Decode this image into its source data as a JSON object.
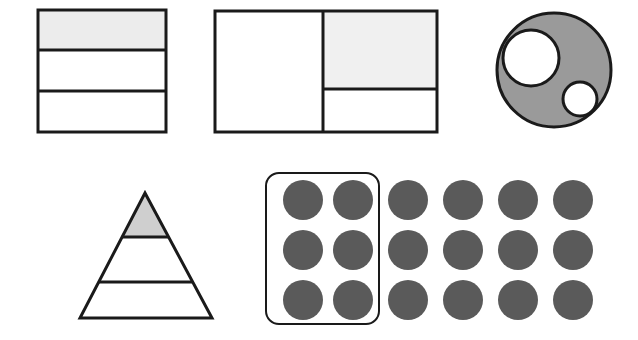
{
  "page": {
    "width": 638,
    "height": 340,
    "background_color": "#ffffff"
  },
  "palette": {
    "stroke": "#1a1a1a",
    "shade_light": "#ececec",
    "shade_medium_light": "#f0f0f0",
    "shade_gray": "#9a9a9a",
    "shade_triangle": "#cfcfcf",
    "dot_fill": "#5a5a5a",
    "white": "#ffffff"
  },
  "figures": [
    {
      "id": "partitioned-square",
      "name": "Square divided into three horizontal bands",
      "type": "square",
      "x": 38,
      "y": 10,
      "width": 128,
      "height": 122,
      "parts_total": 3,
      "parts_shaded": 1,
      "fraction": "1/3",
      "shaded_part_index": 0,
      "divider_y_values": [
        50,
        91
      ],
      "stroke_width": 3,
      "shade_color": "#ececec"
    },
    {
      "id": "partitioned-rectangle",
      "name": "Rectangle divided into left half and two right quarters",
      "type": "rectangle",
      "x": 215,
      "y": 11,
      "width": 222,
      "height": 121,
      "parts_total": 3,
      "parts_shaded": 1,
      "fraction": "1/4",
      "vertical_divider_x": 323,
      "right_horizontal_divider_y": 89,
      "shaded_cell": "top-right",
      "stroke_width": 3,
      "shade_color": "#f0f0f0"
    },
    {
      "id": "gray-circle-with-holes",
      "name": "Gray circle with two white circular holes",
      "type": "circle",
      "cx": 554,
      "cy": 70,
      "r": 57,
      "fill": "#9a9a9a",
      "stroke_width": 3,
      "holes": [
        {
          "name": "large-hole",
          "cx": 531,
          "cy": 58,
          "r": 28,
          "fill": "#ffffff"
        },
        {
          "name": "small-hole",
          "cx": 580,
          "cy": 99,
          "r": 17,
          "fill": "#ffffff"
        }
      ]
    },
    {
      "id": "partitioned-triangle",
      "name": "Triangle divided into three horizontal bands",
      "type": "triangle",
      "apex_x": 145,
      "apex_y": 193,
      "base_left_x": 80,
      "base_right_x": 212,
      "base_y": 318,
      "parts_total": 3,
      "parts_shaded": 1,
      "fraction": "1/3",
      "shaded_part_index": 0,
      "divider_y_values": [
        237,
        282
      ],
      "stroke_width": 3,
      "shade_color": "#cfcfcf"
    },
    {
      "id": "dot-array-with-tray",
      "name": "Array of eighteen dots with six enclosed by a rounded tray",
      "type": "dot-array",
      "rows": 3,
      "columns": 6,
      "total_dots": 18,
      "enclosed_dots": 6,
      "fraction": "6/18",
      "dot_radius": 20,
      "dot_fill": "#5a5a5a",
      "column_centers_x": [
        303,
        353,
        408,
        463,
        518,
        573
      ],
      "row_centers_y": [
        200,
        250,
        300
      ],
      "tray": {
        "name": "rounded-tray-outline",
        "x": 266,
        "y": 173,
        "width": 113,
        "height": 151,
        "corner_radius": 13,
        "stroke_width": 2,
        "fill": "none"
      }
    }
  ]
}
